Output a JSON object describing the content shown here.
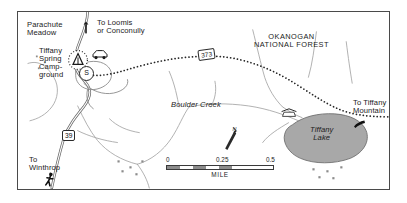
{
  "map": {
    "title": "Tiffany Spring Campground area map",
    "frame": {
      "x": 17,
      "y": 11,
      "width": 373,
      "height": 179,
      "border_color": "#4a4a4a"
    },
    "background_color": "#ffffff",
    "labels": [
      {
        "id": "parachute-meadow",
        "text": "Parachute\nMeadow",
        "x": 26,
        "y": 20,
        "style": "place"
      },
      {
        "id": "to-loomis",
        "text": "To Loomis\nor Conconully",
        "x": 96,
        "y": 18,
        "style": "place"
      },
      {
        "id": "tiffany-spring-campground",
        "text": "Tiffany\nSpring\nCamp-\nground",
        "x": 38,
        "y": 46,
        "style": "place"
      },
      {
        "id": "okanogan-national-forest",
        "text": "OKANOGAN\nNATIONAL FOREST",
        "x": 280,
        "y": 32,
        "style": "forest"
      },
      {
        "id": "boulder-creek",
        "text": "Boulder Creek",
        "x": 170,
        "y": 100,
        "style": "hydro"
      },
      {
        "id": "tiffany-lake",
        "text": "Tiffany\nLake",
        "x": 316,
        "y": 126,
        "style": "hydro"
      },
      {
        "id": "to-tiffany-mountain",
        "text": "To Tiffany\nMountain",
        "x": 352,
        "y": 98,
        "style": "place"
      },
      {
        "id": "to-winthrop",
        "text": "To\nWinthrop",
        "x": 27,
        "y": 155,
        "style": "place"
      }
    ],
    "route_shields": [
      {
        "id": "route-373",
        "number": "373",
        "x": 199,
        "y": 48,
        "rotation": -8
      },
      {
        "id": "route-39",
        "number": "39",
        "x": 63,
        "y": 130,
        "rotation": 0
      }
    ],
    "point_symbols": [
      {
        "id": "campground-tent",
        "name": "tent-icon",
        "x": 76,
        "y": 54,
        "label": "A"
      },
      {
        "id": "parking-car",
        "name": "car-icon",
        "x": 96,
        "y": 50
      },
      {
        "id": "sno-park",
        "name": "s-circle-icon",
        "x": 85,
        "y": 70,
        "label": "S"
      },
      {
        "id": "trailhead-north",
        "name": "trail-marker-icon",
        "x": 85,
        "y": 21
      },
      {
        "id": "picnic-site",
        "name": "picnic-shelter-icon",
        "x": 285,
        "y": 105
      },
      {
        "id": "hiker-winthrop",
        "name": "hiker-icon",
        "x": 45,
        "y": 173
      },
      {
        "id": "hiker-tiffany",
        "name": "hiker-icon",
        "x": 352,
        "y": 115
      }
    ],
    "north_arrow": {
      "id": "north-arrow",
      "label": "N",
      "x": 222,
      "y": 128
    },
    "water": {
      "lake_fill": "#a8a8a8",
      "lake_stroke": "#6f6f6f",
      "stream_stroke": "#9a9a9a"
    },
    "roads": {
      "paved_stroke": "#555555",
      "trail_stroke": "#2a2a2a",
      "trail_style": "dotted"
    }
  },
  "scale_bar": {
    "ticks": [
      "0",
      "0.25",
      "0.5"
    ],
    "tick_positions": [
      0,
      50,
      100
    ],
    "unit": "MILE",
    "segments": [
      0,
      12.5,
      25,
      37.5
    ],
    "fill": "#8d8d8d"
  }
}
